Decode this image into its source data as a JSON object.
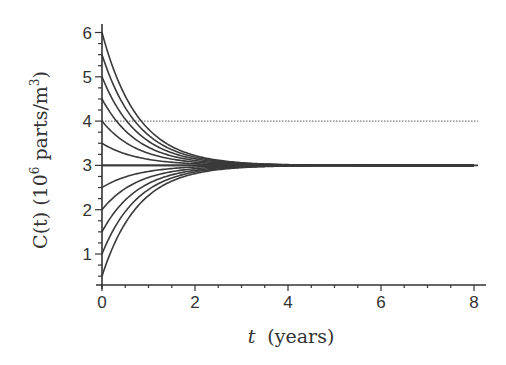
{
  "chart_data": {
    "type": "line",
    "title": "",
    "xlabel": "t (years)",
    "xlabel_var": "t",
    "xlabel_unit": "(years)",
    "ylabel": "C(t) (10^6 parts/m^3)",
    "ylabel_parts": {
      "prefix": "C(t) (10",
      "exp": "6",
      "mid": " parts/m",
      "exp2": "3",
      "suffix": ")"
    },
    "xlim": [
      0,
      8
    ],
    "ylim": [
      0.35,
      6.1
    ],
    "xticks": [
      0,
      2,
      4,
      6,
      8
    ],
    "xtick_labels": [
      "0",
      "2",
      "4",
      "6",
      "8"
    ],
    "yticks": [
      1,
      2,
      3,
      4,
      5,
      6
    ],
    "ytick_labels": [
      "1",
      "2",
      "3",
      "4",
      "5",
      "6"
    ],
    "x_minor_step": 0.5,
    "y_minor_step": 0.25,
    "grid": false,
    "legend": null,
    "model": "C(t) = 3 + (C0 - 3) * exp(-1.3 t)",
    "equilibrium": 3,
    "decay_rate": 1.3,
    "initial_values": [
      6,
      5.5,
      5,
      4.5,
      4,
      3.5,
      3,
      2.5,
      2,
      1.5,
      1,
      0.5
    ],
    "reference_lines": [
      {
        "y": 4,
        "style": "dotted",
        "label": "y = 4"
      },
      {
        "y": 3,
        "style": "solid",
        "label": "equilibrium y = 3"
      }
    ],
    "series": [
      {
        "name": "C0=6",
        "x": [
          0,
          0.5,
          1,
          1.5,
          2,
          3,
          4,
          6,
          8
        ],
        "values": [
          6,
          4.57,
          3.82,
          3.43,
          3.22,
          3.06,
          3.02,
          3.0,
          3.0
        ]
      },
      {
        "name": "C0=5.5",
        "x": [
          0,
          0.5,
          1,
          1.5,
          2,
          3,
          4,
          6,
          8
        ],
        "values": [
          5.5,
          4.31,
          3.68,
          3.36,
          3.19,
          3.05,
          3.01,
          3.0,
          3.0
        ]
      },
      {
        "name": "C0=5",
        "x": [
          0,
          0.5,
          1,
          1.5,
          2,
          3,
          4,
          6,
          8
        ],
        "values": [
          5,
          4.04,
          3.55,
          3.28,
          3.15,
          3.04,
          3.01,
          3.0,
          3.0
        ]
      },
      {
        "name": "C0=4.5",
        "x": [
          0,
          0.5,
          1,
          1.5,
          2,
          3,
          4,
          6,
          8
        ],
        "values": [
          4.5,
          3.78,
          3.41,
          3.21,
          3.11,
          3.03,
          3.01,
          3.0,
          3.0
        ]
      },
      {
        "name": "C0=4",
        "x": [
          0,
          0.5,
          1,
          1.5,
          2,
          3,
          4,
          6,
          8
        ],
        "values": [
          4,
          3.52,
          3.27,
          3.14,
          3.07,
          3.02,
          3.01,
          3.0,
          3.0
        ]
      },
      {
        "name": "C0=3.5",
        "x": [
          0,
          0.5,
          1,
          1.5,
          2,
          3,
          4,
          6,
          8
        ],
        "values": [
          3.5,
          3.26,
          3.14,
          3.07,
          3.04,
          3.01,
          3.0,
          3.0,
          3.0
        ]
      },
      {
        "name": "C0=3",
        "x": [
          0,
          0.5,
          1,
          1.5,
          2,
          3,
          4,
          6,
          8
        ],
        "values": [
          3,
          3,
          3,
          3,
          3,
          3,
          3,
          3,
          3
        ]
      },
      {
        "name": "C0=2.5",
        "x": [
          0,
          0.5,
          1,
          1.5,
          2,
          3,
          4,
          6,
          8
        ],
        "values": [
          2.5,
          2.74,
          2.86,
          2.93,
          2.96,
          2.99,
          3.0,
          3.0,
          3.0
        ]
      },
      {
        "name": "C0=2",
        "x": [
          0,
          0.5,
          1,
          1.5,
          2,
          3,
          4,
          6,
          8
        ],
        "values": [
          2,
          2.48,
          2.73,
          2.86,
          2.93,
          2.98,
          2.99,
          3.0,
          3.0
        ]
      },
      {
        "name": "C0=1.5",
        "x": [
          0,
          0.5,
          1,
          1.5,
          2,
          3,
          4,
          6,
          8
        ],
        "values": [
          1.5,
          2.22,
          2.59,
          2.79,
          2.89,
          2.97,
          2.99,
          3.0,
          3.0
        ]
      },
      {
        "name": "C0=1",
        "x": [
          0,
          0.5,
          1,
          1.5,
          2,
          3,
          4,
          6,
          8
        ],
        "values": [
          1,
          1.96,
          2.45,
          2.72,
          2.85,
          2.96,
          2.99,
          3.0,
          3.0
        ]
      },
      {
        "name": "C0=0.5",
        "x": [
          0,
          0.5,
          1,
          1.5,
          2,
          3,
          4,
          6,
          8
        ],
        "values": [
          0.5,
          1.69,
          2.32,
          2.64,
          2.81,
          2.95,
          2.99,
          3.0,
          3.0
        ]
      }
    ],
    "colors": {
      "curves": "#3a3a3a",
      "axes": "#333333",
      "dotted_line": "#777777",
      "text": "#333333"
    }
  }
}
